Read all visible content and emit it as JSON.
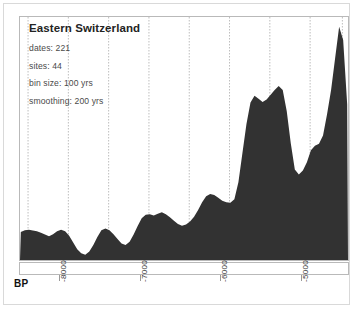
{
  "chart_data": {
    "type": "area",
    "title": "Eastern Switzerland",
    "xlabel": "BP",
    "ylabel": "",
    "grid": true,
    "legend_position": "none",
    "xlim": [
      -8500,
      -4430
    ],
    "ylim": [
      0,
      1
    ],
    "xtick_labels": [
      "-8000",
      "-7000",
      "-6000",
      "-5000"
    ],
    "xticks": [
      -8000,
      -7000,
      -6000,
      -5000
    ],
    "gridline_interval_yrs": 500,
    "gridlines": [
      -8400,
      -7900,
      -7400,
      -6900,
      -6400,
      -5900,
      -5400,
      -4900,
      -4500
    ],
    "annotations": {
      "dates": "dates: 221",
      "sites": "sites: 44",
      "bin_size": "bin size: 100 yrs",
      "smoothing": "smoothing: 200 yrs"
    },
    "series": [
      {
        "name": "summed probability distribution",
        "x": [
          -8490,
          -8440,
          -8390,
          -8340,
          -8290,
          -8240,
          -8190,
          -8140,
          -8090,
          -8040,
          -7990,
          -7940,
          -7890,
          -7840,
          -7790,
          -7740,
          -7690,
          -7640,
          -7590,
          -7540,
          -7490,
          -7440,
          -7390,
          -7340,
          -7290,
          -7240,
          -7190,
          -7140,
          -7090,
          -7040,
          -6990,
          -6940,
          -6890,
          -6840,
          -6790,
          -6740,
          -6690,
          -6640,
          -6590,
          -6540,
          -6490,
          -6440,
          -6390,
          -6340,
          -6290,
          -6240,
          -6190,
          -6140,
          -6090,
          -6040,
          -5990,
          -5940,
          -5890,
          -5840,
          -5790,
          -5740,
          -5690,
          -5640,
          -5590,
          -5540,
          -5490,
          -5440,
          -5390,
          -5340,
          -5290,
          -5240,
          -5190,
          -5140,
          -5090,
          -5040,
          -4990,
          -4940,
          -4890,
          -4840,
          -4790,
          -4740,
          -4690,
          -4640,
          -4590,
          -4540,
          -4490,
          -4440
        ],
        "values": [
          0.115,
          0.122,
          0.124,
          0.121,
          0.118,
          0.112,
          0.105,
          0.098,
          0.106,
          0.118,
          0.124,
          0.118,
          0.1,
          0.072,
          0.044,
          0.028,
          0.022,
          0.035,
          0.062,
          0.095,
          0.122,
          0.13,
          0.122,
          0.106,
          0.086,
          0.068,
          0.062,
          0.075,
          0.105,
          0.14,
          0.172,
          0.186,
          0.188,
          0.183,
          0.19,
          0.196,
          0.188,
          0.176,
          0.162,
          0.148,
          0.141,
          0.146,
          0.158,
          0.178,
          0.206,
          0.238,
          0.262,
          0.272,
          0.268,
          0.256,
          0.244,
          0.238,
          0.236,
          0.25,
          0.32,
          0.44,
          0.56,
          0.648,
          0.676,
          0.664,
          0.65,
          0.66,
          0.68,
          0.7,
          0.716,
          0.7,
          0.612,
          0.48,
          0.372,
          0.352,
          0.368,
          0.402,
          0.452,
          0.47,
          0.478,
          0.512,
          0.6,
          0.7,
          0.83,
          0.96,
          0.905,
          0.64
        ],
        "color": "#323232"
      }
    ]
  },
  "axis": {
    "label": "BP"
  },
  "style": {
    "area_fill": "#323232",
    "gridline_color": "#bdbdbd",
    "frame_color": "#b9b9b9",
    "card_border": "#d9d9d9",
    "text_color": "#4a4a4a",
    "title_color": "#232323"
  }
}
